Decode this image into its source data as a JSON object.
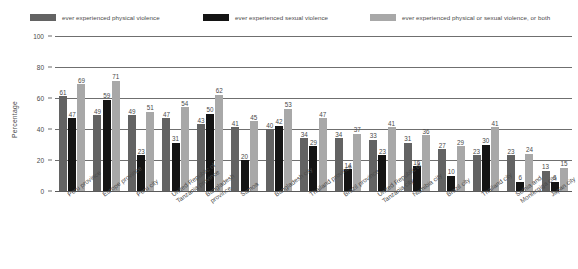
{
  "chart_data": {
    "type": "bar",
    "title": "",
    "xlabel": "",
    "ylabel": "Percentage",
    "ylim": [
      0,
      100
    ],
    "yticks": [
      0,
      20,
      40,
      60,
      80,
      100
    ],
    "grid": true,
    "legend_position": "top",
    "categories": [
      "Peru province",
      "Europe province",
      "Peru city",
      "United Republic of\nTanzania province",
      "Bangladesh\nprovince",
      "Samoa",
      "Bangladesh city",
      "Thailand province",
      "Brazil province",
      "United Republic of\nTanzania city",
      "Namibia city",
      "Brazil city",
      "Thailand city",
      "Sethia and\nMontergiga city",
      "Japan city"
    ],
    "series": [
      {
        "name": "ever experienced physical violence",
        "color": "#636363",
        "values": [
          61,
          49,
          49,
          47,
          43,
          41,
          40,
          34,
          34,
          33,
          31,
          27,
          23,
          23,
          13
        ]
      },
      {
        "name": "ever experienced sexual violence",
        "color": "#141414",
        "values": [
          47,
          59,
          23,
          31,
          50,
          20,
          42,
          29,
          14,
          23,
          16,
          10,
          30,
          6,
          6
        ]
      },
      {
        "name": "ever experienced physical or sexual violence, or both",
        "color": "#a8a8a8",
        "values": [
          69,
          71,
          51,
          54,
          62,
          45,
          53,
          47,
          37,
          41,
          36,
          29,
          41,
          24,
          15
        ]
      }
    ]
  },
  "legend": {
    "items": [
      {
        "label": "ever experienced physical violence",
        "color": "#636363"
      },
      {
        "label": "ever experienced sexual violence",
        "color": "#141414"
      },
      {
        "label": "ever experienced physical or sexual violence, or both",
        "color": "#a8a8a8"
      }
    ]
  },
  "axes": {
    "y_title": "Percentage",
    "y_ticks": [
      "100",
      "80",
      "60",
      "40",
      "20",
      "0"
    ]
  }
}
